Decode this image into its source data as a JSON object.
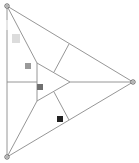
{
  "diagram": {
    "width": 139,
    "height": 163,
    "background": "#ffffff",
    "line_color": "#8a8a8a",
    "line_width": 0.9,
    "outer_triangle": {
      "vertices": [
        [
          7,
          6
        ],
        [
          133,
          82
        ],
        [
          7,
          157
        ]
      ]
    },
    "inner_triangle": {
      "vertices": [
        [
          37,
          63
        ],
        [
          70,
          82
        ],
        [
          37,
          101
        ]
      ]
    },
    "connectors": [
      {
        "from": [
          7,
          6
        ],
        "to": [
          37,
          63
        ]
      },
      {
        "from": [
          7,
          157
        ],
        "to": [
          37,
          101
        ]
      },
      {
        "from": [
          70,
          82
        ],
        "to": [
          133,
          82
        ]
      },
      {
        "from": [
          54,
          72
        ],
        "to": [
          69,
          44
        ]
      },
      {
        "from": [
          37,
          82
        ],
        "to": [
          7,
          82
        ]
      },
      {
        "from": [
          54,
          92
        ],
        "to": [
          69,
          120
        ]
      }
    ],
    "vertex_markers": [
      {
        "name": "top-left",
        "cx": 7,
        "cy": 6,
        "r": 2.2
      },
      {
        "name": "right",
        "cx": 133,
        "cy": 82,
        "r": 2.2
      },
      {
        "name": "bottom-left",
        "cx": 7,
        "cy": 157,
        "r": 2.2
      }
    ],
    "trail_markers": [
      {
        "x": 6,
        "y": 20,
        "w": 2,
        "h": 10,
        "color": "#e6e6e6"
      },
      {
        "x": 12,
        "y": 34,
        "w": 8,
        "h": 9,
        "color": "#dcdcdc"
      },
      {
        "x": 25,
        "y": 63,
        "w": 6,
        "h": 6,
        "color": "#9a9a9a"
      },
      {
        "x": 37,
        "y": 84,
        "w": 6,
        "h": 6,
        "color": "#707070"
      },
      {
        "x": 57,
        "y": 116,
        "w": 6,
        "h": 6,
        "color": "#222222"
      }
    ]
  }
}
